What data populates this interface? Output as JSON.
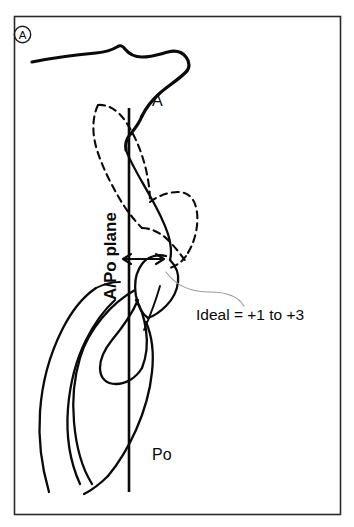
{
  "figure": {
    "panel_badge": "A",
    "caption_type": "cephalometric-tracing",
    "labels": {
      "point_a": "A",
      "point_po": "Po",
      "plane": "A/Po plane",
      "ideal": "Ideal = +1 to +3"
    },
    "colors": {
      "ink": "#0a0a0a",
      "border": "#2a2a2a",
      "leader": "#9a9a9a",
      "background": "#ffffff"
    },
    "annotations": {
      "measure_arrow_name": "incisor-protrusion-double-arrow",
      "plane_line_name": "a-po-reference-line"
    }
  }
}
